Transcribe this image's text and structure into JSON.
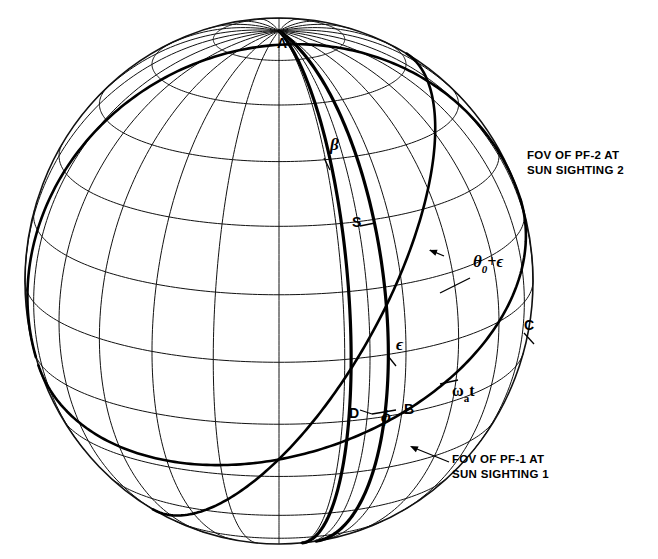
{
  "figure": {
    "type": "sphere-wireframe-diagram",
    "background_color": "#ffffff",
    "line_color": "#111111"
  },
  "sphere": {
    "center_x": 279,
    "center_y": 281,
    "radius_x": 254,
    "radius_y": 263,
    "pole_label": "A",
    "meridian_count": 24,
    "parallel_count": 12
  },
  "point_labels": [
    {
      "id": "pole-a",
      "text": "A",
      "x": 277,
      "y": 48
    },
    {
      "id": "point-s",
      "text": "S",
      "x": 352,
      "y": 227
    },
    {
      "id": "point-c",
      "text": "C",
      "x": 524,
      "y": 330
    },
    {
      "id": "point-d",
      "text": "D",
      "x": 349,
      "y": 418
    },
    {
      "id": "point-b",
      "text": "B",
      "x": 404,
      "y": 414
    }
  ],
  "angle_labels": [
    {
      "id": "beta",
      "text": "β",
      "x": 330,
      "y": 150
    },
    {
      "id": "theta0-plus-epsilon",
      "text": "θ",
      "sub": "0",
      "suffix": "+ϵ",
      "x": 473,
      "y": 267
    },
    {
      "id": "epsilon",
      "text": "ϵ",
      "x": 396,
      "y": 350
    },
    {
      "id": "omega-a-t",
      "text": "ω",
      "sub": "a",
      "suffix": "t",
      "x": 452,
      "y": 396
    },
    {
      "id": "phi",
      "text": "ϕ",
      "x": 381,
      "y": 422
    }
  ],
  "callouts": [
    {
      "id": "fov-pf2",
      "line1": "FOV OF PF-2 AT",
      "line2": "SUN SIGHTING 2",
      "x": 527,
      "y": 148
    },
    {
      "id": "fov-pf1",
      "line1": "FOV OF PF-1 AT",
      "line2": "SUN SIGHTING 1",
      "x": 452,
      "y": 452
    }
  ],
  "chart_data": {
    "type": "diagram",
    "title": "",
    "elements": [
      "wireframe sphere with latitude/longitude grid",
      "two thick great circles from pole A through point S (field-of-view edges)",
      "thick great circle through S and C (sun line / ecliptic-like arc)",
      "thick parallel-like arc through D and B (equator)",
      "leader arrows to FOV callouts"
    ],
    "annotations": [
      "A",
      "S",
      "C",
      "D",
      "B",
      "β",
      "θ₀+ϵ",
      "ϵ",
      "ωₐt",
      "ϕ"
    ]
  }
}
